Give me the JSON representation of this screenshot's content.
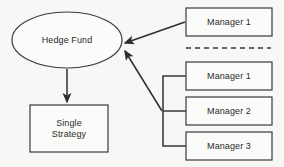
{
  "diagram": {
    "background_color": "#f7f7f5",
    "stroke_color": "#3a3a3a",
    "text_color": "#2b2b2b",
    "fill_color": "#fbfbf9"
  },
  "nodes": {
    "hedge_fund": {
      "label": "Hedge Fund",
      "shape": "ellipse"
    },
    "single_strategy": {
      "label": "Single\nStrategy",
      "shape": "rectangle"
    },
    "manager_top": {
      "label": "Manager 1",
      "shape": "rectangle"
    },
    "manager_1": {
      "label": "Manager 1",
      "shape": "rectangle"
    },
    "manager_2": {
      "label": "Manager 2",
      "shape": "rectangle"
    },
    "manager_3": {
      "label": "Manager 3",
      "shape": "rectangle"
    }
  },
  "connectors": {
    "manager_top_to_fund": "arrow",
    "bracket_to_fund": "arrow",
    "fund_to_strategy": "arrow",
    "manager_bracket": "bracket"
  },
  "separator": {
    "style": "dashed-line"
  }
}
